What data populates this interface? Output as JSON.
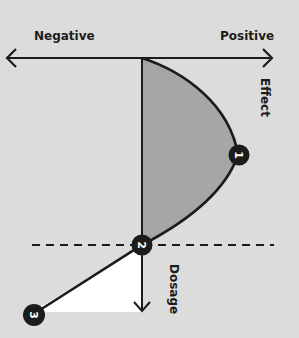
{
  "diagram": {
    "axis_horizontal": {
      "left_label": "Negative",
      "right_label": "Positive",
      "axis_label": "Effect"
    },
    "axis_vertical": {
      "axis_label": "Dosage"
    },
    "markers": [
      {
        "id": "1",
        "label": "1"
      },
      {
        "id": "2",
        "label": "2"
      },
      {
        "id": "3",
        "label": "3"
      }
    ],
    "colors": {
      "background": "#dcdcdc",
      "positive_area": "#a6a6a6",
      "negative_area": "#ffffff",
      "line": "#1c1c1c",
      "marker_fill": "#1c1c1c"
    }
  }
}
